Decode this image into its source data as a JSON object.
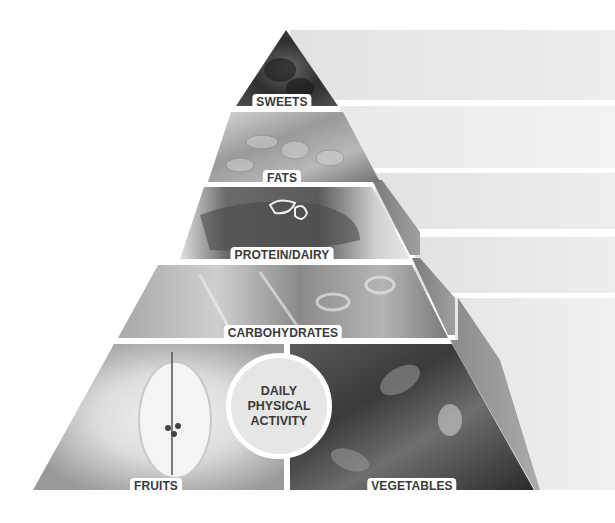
{
  "pyramid": {
    "tiers": [
      {
        "id": "sweets",
        "label": "SWEETS",
        "image": "chocolates"
      },
      {
        "id": "fats",
        "label": "FATS",
        "image": "almonds"
      },
      {
        "id": "protein",
        "label": "PROTEIN/DAIRY",
        "image": "grilled-meat"
      },
      {
        "id": "carbs",
        "label": "CARBOHYDRATES",
        "image": "penne-pasta"
      },
      {
        "id": "fruits",
        "label": "FRUITS",
        "image": "halved-apple"
      },
      {
        "id": "vegetables",
        "label": "VEGETABLES",
        "image": "leafy-greens"
      }
    ],
    "center_badge": {
      "line1": "DAILY",
      "line2": "PHYSICAL",
      "line3": "ACTIVITY"
    }
  },
  "colors": {
    "background": "#ffffff",
    "shelf": "#e4e4e4",
    "side_face": "#8a8a8a",
    "label_bg": "#ffffff",
    "label_text": "#3a3a3a",
    "badge_bg": "#e6e6e6"
  }
}
